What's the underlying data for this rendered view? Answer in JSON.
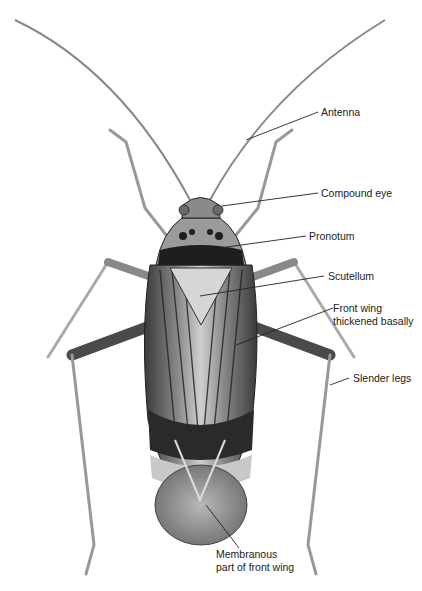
{
  "figure": {
    "labels": [
      {
        "id": "antenna",
        "lines": [
          "Antenna"
        ]
      },
      {
        "id": "compound-eye",
        "lines": [
          "Compound eye"
        ]
      },
      {
        "id": "pronotum",
        "lines": [
          "Pronotum"
        ]
      },
      {
        "id": "scutellum",
        "lines": [
          "Scutellum"
        ]
      },
      {
        "id": "front-wing",
        "lines": [
          "Front wing",
          "thickened basally"
        ]
      },
      {
        "id": "slender-legs",
        "lines": [
          "Slender legs"
        ]
      },
      {
        "id": "membranous",
        "lines": [
          "Membranous",
          "part of front wing"
        ]
      }
    ]
  }
}
